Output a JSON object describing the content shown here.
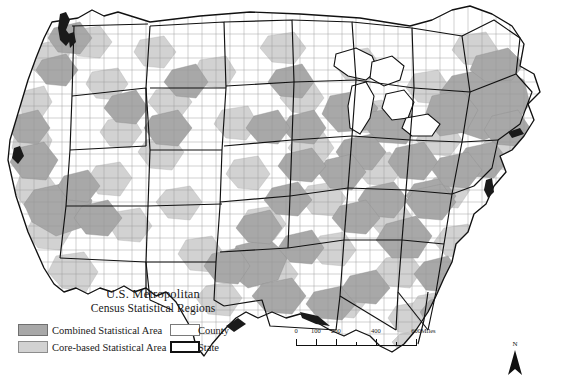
{
  "figure": {
    "kind": "choropleth-map",
    "region": "Contiguous United States",
    "background_color": "#ffffff"
  },
  "title": {
    "line1": "U.S. Metropolitan",
    "line2": "Census Statistical Regions"
  },
  "legend": {
    "items": [
      {
        "key": "csa",
        "label": "Combined Statistical Area",
        "fill": "#a8a8a8",
        "stroke": "#6f6f6f",
        "stroke_width": 1
      },
      {
        "key": "cbsa",
        "label": "Core-based Statistical Area",
        "fill": "#d2d2d2",
        "stroke": "#8d8d8d",
        "stroke_width": 1
      },
      {
        "key": "county",
        "label": "County",
        "fill": "#ffffff",
        "stroke": "#7a7a7a",
        "stroke_width": 1
      },
      {
        "key": "state",
        "label": "State",
        "fill": "#ffffff",
        "stroke": "#111111",
        "stroke_width": 2
      }
    ]
  },
  "scalebar": {
    "unit": "Miles",
    "labels": [
      "0",
      "100",
      "200",
      "400",
      "600"
    ],
    "label_positions_pct": [
      0,
      16.6,
      33.3,
      66.6,
      100
    ],
    "minor_tick_positions_pct": [
      50,
      83.3
    ]
  },
  "north_arrow": {
    "label": "N"
  },
  "map_colors": {
    "water": "#ffffff",
    "county_fill": "#ffffff",
    "county_line": "#9a9a9a",
    "state_line": "#111111",
    "csa_fill": "#a8a8a8",
    "cbsa_fill": "#d2d2d2",
    "coast_line": "#111111"
  }
}
